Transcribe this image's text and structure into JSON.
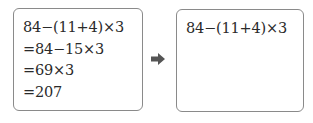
{
  "left_box": {
    "lines": [
      "84−(11+4)×3",
      "=84−15×3",
      "=69×3",
      "=207"
    ]
  },
  "arrow": {
    "icon": "right-arrow-icon",
    "color": "#555555"
  },
  "right_box": {
    "lines": [
      "84−(11+4)×3"
    ]
  }
}
